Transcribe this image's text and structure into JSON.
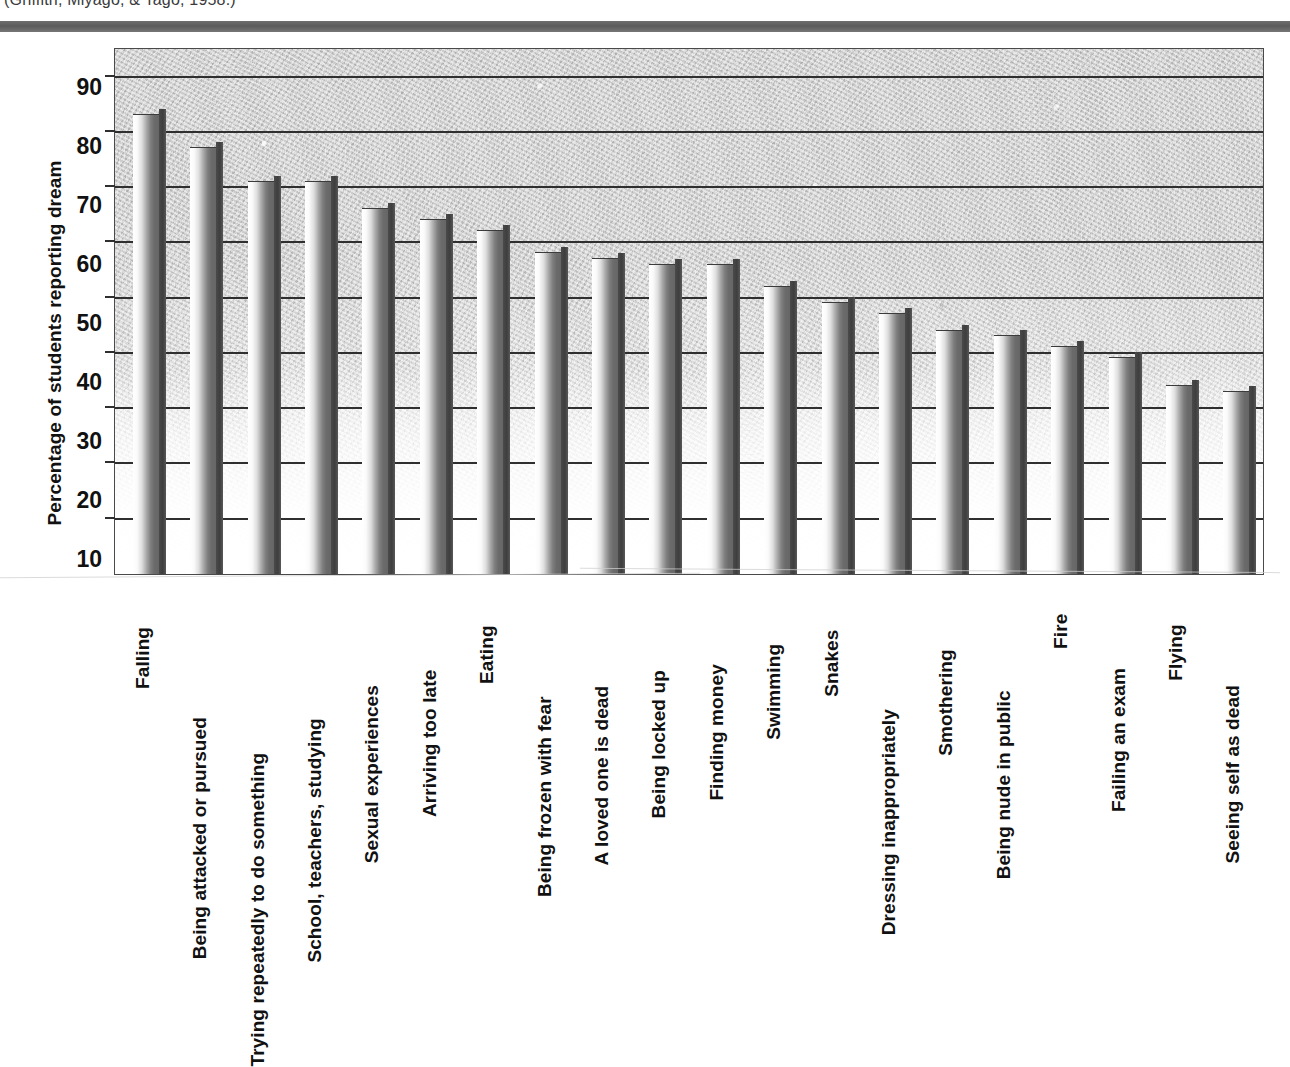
{
  "citation": "(Griffith, Miyago, & Tago, 1958.)",
  "axis": {
    "y_title": "Percentage of students reporting dream",
    "y_ticks": [
      "90",
      "80",
      "70",
      "60",
      "50",
      "40",
      "30",
      "20",
      "10"
    ]
  },
  "chart_data": {
    "type": "bar",
    "title": "",
    "subtitle": "",
    "xlabel": "",
    "ylabel": "Percentage of students reporting dream",
    "ylim": [
      0,
      95
    ],
    "yticks": [
      10,
      20,
      30,
      40,
      50,
      60,
      70,
      80,
      90
    ],
    "grid": true,
    "legend": "none",
    "orientation": "vertical",
    "categories": [
      "Falling",
      "Being attacked or pursued",
      "Trying repeatedly to do something",
      "School, teachers, studying",
      "Sexual experiences",
      "Arriving too late",
      "Eating",
      "Being frozen with fear",
      "A loved one is dead",
      "Being locked up",
      "Finding money",
      "Swimming",
      "Snakes",
      "Dressing inappropriately",
      "Smothering",
      "Being nude in public",
      "Fire",
      "Failing an exam",
      "Flying",
      "Seeing self as dead"
    ],
    "values": [
      83,
      77,
      71,
      71,
      66,
      64,
      62,
      58,
      57,
      56,
      56,
      52,
      49,
      47,
      44,
      43,
      41,
      39,
      34,
      33
    ]
  },
  "colors": {
    "bar_light": "#ffffff",
    "bar_dark": "#666666",
    "bar_edge": "#454545",
    "gridline": "#2f2f2f",
    "text": "#111111",
    "plot_bg": "#cfcfcf",
    "top_rule": "#6e6e6e"
  }
}
